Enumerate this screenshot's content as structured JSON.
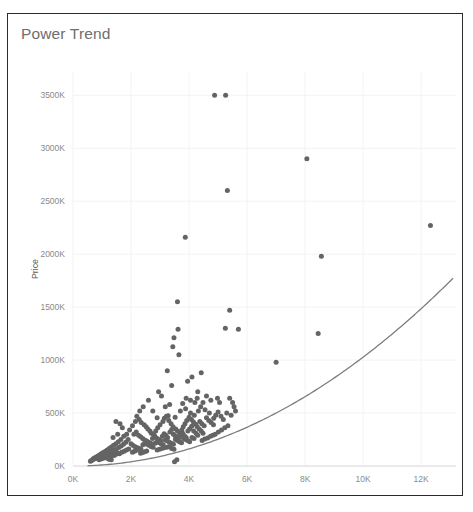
{
  "card": {
    "title": "Power Trend",
    "border_color": "#2b2b2b",
    "background": "#ffffff"
  },
  "chart_data": {
    "type": "scatter",
    "title": "Power Trend",
    "xlabel": "Size (Sq Ft)",
    "ylabel": "Price",
    "xlim": [
      0,
      13200
    ],
    "ylim": [
      0,
      3720
    ],
    "grid": true,
    "legend": null,
    "point_color": "#646464",
    "trend_color": "#7d7d7d",
    "xticks": [
      0,
      2000,
      4000,
      6000,
      8000,
      10000,
      12000
    ],
    "xticklabels": [
      "0K",
      "2K",
      "4K",
      "6K",
      "8K",
      "10K",
      "12K"
    ],
    "yticks": [
      0,
      500,
      1000,
      1500,
      2000,
      2500,
      3000,
      3500
    ],
    "yticklabels": [
      "0K",
      "500K",
      "1000K",
      "1500K",
      "2000K",
      "2500K",
      "3000K",
      "3500K"
    ],
    "trendline": {
      "label": "Power Trend",
      "type": "power",
      "coefficient": 8.55e-06,
      "exponent": 2.02,
      "x_start": 500,
      "x_end": 13100
    },
    "series": [
      {
        "name": "Properties",
        "points": [
          [
            4880,
            3500
          ],
          [
            5260,
            3500
          ],
          [
            8060,
            2900
          ],
          [
            5320,
            2600
          ],
          [
            12320,
            2270
          ],
          [
            8560,
            1980
          ],
          [
            3870,
            2160
          ],
          [
            5400,
            1470
          ],
          [
            5250,
            1300
          ],
          [
            5700,
            1290
          ],
          [
            3600,
            1550
          ],
          [
            3620,
            1290
          ],
          [
            3480,
            1210
          ],
          [
            3440,
            1125
          ],
          [
            3650,
            1050
          ],
          [
            7000,
            980
          ],
          [
            8450,
            1250
          ],
          [
            4420,
            880
          ],
          [
            4100,
            840
          ],
          [
            3950,
            800
          ],
          [
            3250,
            900
          ],
          [
            3400,
            760
          ],
          [
            2950,
            700
          ],
          [
            3050,
            660
          ],
          [
            4300,
            700
          ],
          [
            4600,
            660
          ],
          [
            4750,
            620
          ],
          [
            5050,
            600
          ],
          [
            5400,
            640
          ],
          [
            5500,
            600
          ],
          [
            3180,
            560
          ],
          [
            3330,
            580
          ],
          [
            2420,
            560
          ],
          [
            2300,
            520
          ],
          [
            2600,
            620
          ],
          [
            2750,
            520
          ],
          [
            3520,
            460
          ],
          [
            2900,
            455
          ],
          [
            3700,
            520
          ],
          [
            3880,
            540
          ],
          [
            4050,
            500
          ],
          [
            4180,
            480
          ],
          [
            4320,
            520
          ],
          [
            4400,
            560
          ],
          [
            4550,
            530
          ],
          [
            4700,
            500
          ],
          [
            4850,
            450
          ],
          [
            3280,
            475
          ],
          [
            2150,
            420
          ],
          [
            2050,
            380
          ],
          [
            1950,
            340
          ],
          [
            1850,
            300
          ],
          [
            1750,
            280
          ],
          [
            1650,
            250
          ],
          [
            1560,
            230
          ],
          [
            1480,
            210
          ],
          [
            1400,
            195
          ],
          [
            1320,
            180
          ],
          [
            1250,
            165
          ],
          [
            1180,
            150
          ],
          [
            1120,
            140
          ],
          [
            1060,
            130
          ],
          [
            1000,
            120
          ],
          [
            950,
            110
          ],
          [
            900,
            100
          ],
          [
            860,
            95
          ],
          [
            820,
            88
          ],
          [
            780,
            80
          ],
          [
            740,
            75
          ],
          [
            700,
            68
          ],
          [
            1480,
            420
          ],
          [
            1620,
            400
          ],
          [
            1700,
            360
          ],
          [
            1540,
            300
          ],
          [
            1380,
            270
          ],
          [
            2200,
            470
          ],
          [
            2280,
            440
          ],
          [
            2350,
            410
          ],
          [
            2450,
            390
          ],
          [
            2520,
            370
          ],
          [
            2580,
            350
          ],
          [
            2650,
            330
          ],
          [
            2700,
            310
          ],
          [
            2780,
            295
          ],
          [
            2850,
            330
          ],
          [
            2920,
            360
          ],
          [
            3000,
            390
          ],
          [
            3100,
            420
          ],
          [
            3150,
            450
          ],
          [
            3220,
            470
          ],
          [
            3300,
            430
          ],
          [
            3380,
            400
          ],
          [
            3450,
            370
          ],
          [
            3540,
            350
          ],
          [
            3600,
            330
          ],
          [
            3680,
            310
          ],
          [
            3750,
            340
          ],
          [
            3800,
            370
          ],
          [
            3860,
            400
          ],
          [
            3920,
            430
          ],
          [
            4000,
            460
          ],
          [
            4080,
            440
          ],
          [
            4150,
            415
          ],
          [
            4230,
            395
          ],
          [
            4280,
            370
          ],
          [
            4350,
            350
          ],
          [
            4420,
            330
          ],
          [
            4480,
            310
          ],
          [
            1900,
            250
          ],
          [
            1820,
            225
          ],
          [
            1740,
            205
          ],
          [
            1660,
            190
          ],
          [
            1580,
            175
          ],
          [
            1500,
            160
          ],
          [
            1430,
            150
          ],
          [
            1360,
            140
          ],
          [
            1290,
            132
          ],
          [
            1220,
            125
          ],
          [
            1150,
            118
          ],
          [
            1090,
            110
          ],
          [
            1030,
            102
          ],
          [
            980,
            96
          ],
          [
            930,
            90
          ],
          [
            880,
            85
          ],
          [
            840,
            80
          ],
          [
            800,
            74
          ],
          [
            760,
            70
          ],
          [
            720,
            65
          ],
          [
            680,
            60
          ],
          [
            650,
            55
          ],
          [
            620,
            50
          ],
          [
            600,
            45
          ],
          [
            2100,
            300
          ],
          [
            2180,
            320
          ],
          [
            2260,
            290
          ],
          [
            2330,
            275
          ],
          [
            2400,
            260
          ],
          [
            2470,
            245
          ],
          [
            2540,
            235
          ],
          [
            2610,
            225
          ],
          [
            2680,
            215
          ],
          [
            2740,
            260
          ],
          [
            2810,
            285
          ],
          [
            2880,
            265
          ],
          [
            2960,
            250
          ],
          [
            3020,
            240
          ],
          [
            3080,
            280
          ],
          [
            3140,
            305
          ],
          [
            3200,
            290
          ],
          [
            3260,
            270
          ],
          [
            3340,
            320
          ],
          [
            3400,
            345
          ],
          [
            3460,
            300
          ],
          [
            3520,
            285
          ],
          [
            3580,
            275
          ],
          [
            3640,
            265
          ],
          [
            3720,
            290
          ],
          [
            3780,
            310
          ],
          [
            3840,
            285
          ],
          [
            3900,
            270
          ],
          [
            3960,
            330
          ],
          [
            4020,
            350
          ],
          [
            4090,
            375
          ],
          [
            4160,
            330
          ],
          [
            4240,
            310
          ],
          [
            4300,
            290
          ],
          [
            4370,
            420
          ],
          [
            4440,
            400
          ],
          [
            4520,
            380
          ],
          [
            4600,
            455
          ],
          [
            4680,
            430
          ],
          [
            4760,
            410
          ],
          [
            4840,
            390
          ],
          [
            4920,
            480
          ],
          [
            5000,
            510
          ],
          [
            5100,
            470
          ],
          [
            5180,
            440
          ],
          [
            5300,
            500
          ],
          [
            5450,
            480
          ],
          [
            5600,
            520
          ],
          [
            2000,
            210
          ],
          [
            2060,
            195
          ],
          [
            2130,
            185
          ],
          [
            2200,
            175
          ],
          [
            2270,
            168
          ],
          [
            2340,
            160
          ],
          [
            2410,
            200
          ],
          [
            2480,
            215
          ],
          [
            2550,
            205
          ],
          [
            2620,
            195
          ],
          [
            2690,
            185
          ],
          [
            2760,
            178
          ],
          [
            2830,
            215
          ],
          [
            2900,
            230
          ],
          [
            2970,
            220
          ],
          [
            3040,
            210
          ],
          [
            3110,
            200
          ],
          [
            3180,
            245
          ],
          [
            3250,
            235
          ],
          [
            3320,
            225
          ],
          [
            3390,
            215
          ],
          [
            3460,
            205
          ],
          [
            3530,
            250
          ],
          [
            3600,
            240
          ],
          [
            3670,
            230
          ],
          [
            3740,
            220
          ],
          [
            3810,
            260
          ],
          [
            3880,
            250
          ],
          [
            3950,
            240
          ],
          [
            4020,
            230
          ],
          [
            4100,
            270
          ],
          [
            4170,
            260
          ],
          [
            1180,
            90
          ],
          [
            1240,
            85
          ],
          [
            1300,
            95
          ],
          [
            1360,
            105
          ],
          [
            1420,
            100
          ],
          [
            1480,
            112
          ],
          [
            1540,
            120
          ],
          [
            1600,
            115
          ],
          [
            1680,
            130
          ],
          [
            1760,
            140
          ],
          [
            1840,
            150
          ],
          [
            1920,
            160
          ],
          [
            3500,
            40
          ],
          [
            3580,
            60
          ],
          [
            4450,
            240
          ],
          [
            4540,
            255
          ],
          [
            4640,
            265
          ],
          [
            4740,
            280
          ],
          [
            4820,
            290
          ],
          [
            4900,
            300
          ],
          [
            5010,
            320
          ],
          [
            5120,
            340
          ],
          [
            5230,
            360
          ],
          [
            5340,
            380
          ],
          [
            900,
            60
          ],
          [
            960,
            65
          ],
          [
            1020,
            70
          ],
          [
            1080,
            78
          ],
          [
            1140,
            82
          ],
          [
            1200,
            70
          ],
          [
            1260,
            62
          ],
          [
            1320,
            58
          ],
          [
            2050,
            130
          ],
          [
            2120,
            140
          ],
          [
            2190,
            148
          ],
          [
            2260,
            155
          ],
          [
            2330,
            120
          ],
          [
            2400,
            128
          ],
          [
            2470,
            135
          ],
          [
            2540,
            142
          ],
          [
            2900,
            150
          ],
          [
            2980,
            158
          ],
          [
            3060,
            165
          ],
          [
            3140,
            172
          ],
          [
            3240,
            178
          ],
          [
            3320,
            185
          ],
          [
            3400,
            165
          ],
          [
            3480,
            158
          ],
          [
            4200,
            600
          ],
          [
            4050,
            620
          ],
          [
            3900,
            640
          ],
          [
            3780,
            590
          ],
          [
            4280,
            640
          ],
          [
            4480,
            600
          ],
          [
            4980,
            640
          ],
          [
            5550,
            560
          ]
        ]
      }
    ]
  }
}
